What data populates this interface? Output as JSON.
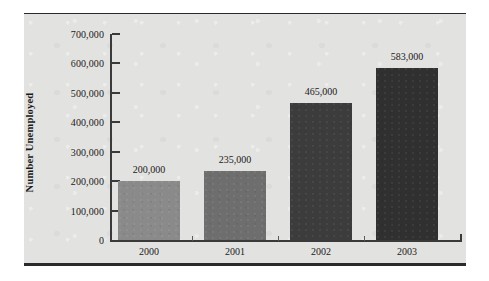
{
  "chart_data": {
    "type": "bar",
    "title": "",
    "xlabel": "",
    "ylabel": "Number Unemployed",
    "categories": [
      "2000",
      "2001",
      "2002",
      "2003"
    ],
    "values": [
      200000,
      235000,
      465000,
      583000
    ],
    "value_labels": [
      "200,000",
      "235,000",
      "465,000",
      "583,000"
    ],
    "ylim": [
      0,
      700000
    ],
    "ytick_values": [
      0,
      100000,
      200000,
      300000,
      400000,
      500000,
      600000,
      700000
    ],
    "ytick_labels": [
      "0",
      "100,000",
      "200,000",
      "300,000",
      "400,000",
      "500,000",
      "600,000",
      "700,000"
    ],
    "grid": false,
    "legend": "none",
    "bar_colors": [
      "#8a8a8a",
      "#6e6e6e",
      "#3c3c3c",
      "#303030"
    ],
    "series": [
      {
        "name": "Number Unemployed",
        "values": [
          200000,
          235000,
          465000,
          583000
        ]
      }
    ]
  },
  "figure": {
    "panel_color": "#e2e2e0",
    "rule_color": "#2b2b2b",
    "axis_color": "#3a3a3a",
    "text_color": "#1a1a1a",
    "background": "#ffffff"
  }
}
